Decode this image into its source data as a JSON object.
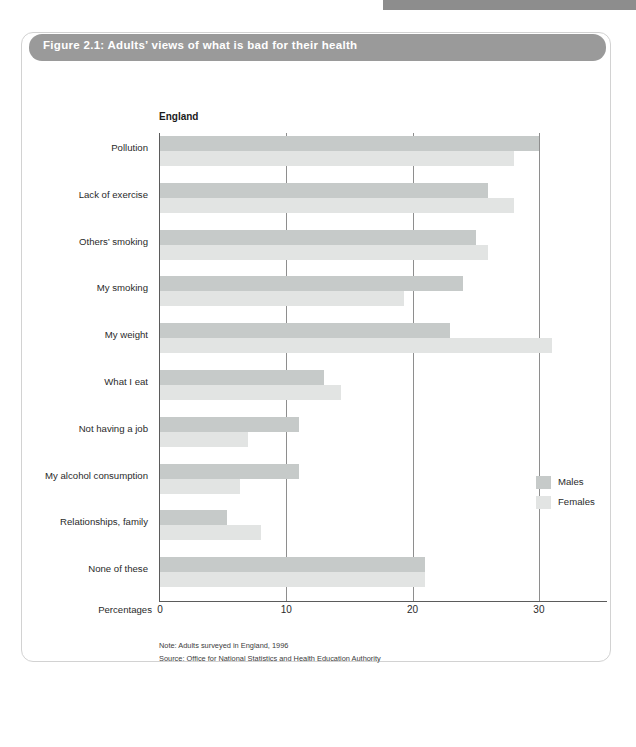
{
  "figure": {
    "title": "Figure 2.1: Adults’ views of what is bad for their health",
    "region_label": "England",
    "x_axis_title": "Percentages",
    "note": "Note: Adults surveyed in England, 1996",
    "source": "Source: Office for National Statistics and Health Education Authority"
  },
  "legend": {
    "position": "right",
    "items": [
      {
        "label": "Males",
        "color": "#c6cac9"
      },
      {
        "label": "Females",
        "color": "#e2e4e3"
      }
    ]
  },
  "colors": {
    "males": "#c6cac9",
    "females": "#e2e4e3",
    "title_bar": "#9a9a9a",
    "axis": "#5b5b5b",
    "gridline": "#8e8e8e"
  },
  "chart_data": {
    "type": "bar",
    "orientation": "horizontal",
    "title": "Figure 2.1: Adults’ views of what is bad for their health",
    "subtitle": "England",
    "xlabel": "Percentages",
    "ylabel": "",
    "xlim": [
      0,
      35.5
    ],
    "xticks": [
      0,
      10,
      20,
      30
    ],
    "xtick_labels": [
      "0",
      "10",
      "20",
      "30"
    ],
    "grid": "vertical",
    "legend_position": "right",
    "categories": [
      "Pollution",
      "Lack of exercise",
      "Others’ smoking",
      "My smoking",
      "My weight",
      "What I eat",
      "Not having a job",
      "My alcohol consumption",
      "Relationships, family",
      "None of these"
    ],
    "series": [
      {
        "name": "Males",
        "color": "#c6cac9",
        "values": [
          30.0,
          26.0,
          25.0,
          24.0,
          23.0,
          13.0,
          11.0,
          11.0,
          5.3,
          21.0
        ]
      },
      {
        "name": "Females",
        "color": "#e2e4e3",
        "values": [
          28.0,
          28.0,
          26.0,
          19.3,
          31.0,
          14.3,
          7.0,
          6.3,
          8.0,
          21.0
        ]
      }
    ],
    "note": "Note: Adults surveyed in England, 1996",
    "source": "Source: Office for National Statistics and Health Education Authority"
  }
}
